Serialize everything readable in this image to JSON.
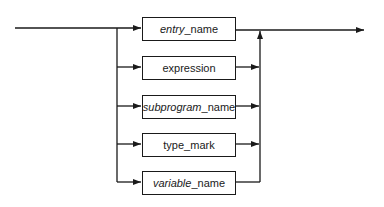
{
  "diagram": {
    "type": "syntax-diagram",
    "boxes": [
      {
        "italic": "entry",
        "plain": "_name"
      },
      {
        "italic": "",
        "plain": "expression"
      },
      {
        "italic": "subprogram",
        "plain": "_name"
      },
      {
        "italic": "",
        "plain": "type_mark"
      },
      {
        "italic": "variable",
        "plain": "_name"
      }
    ],
    "colors": {
      "line": "#1a1a1a",
      "background": "#ffffff"
    }
  }
}
